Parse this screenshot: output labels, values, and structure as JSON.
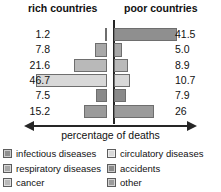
{
  "header": {
    "left_title": "rich countries",
    "right_title": "poor countries"
  },
  "axis": {
    "label": "percentage of deaths",
    "arrow": "double-headed-horizontal"
  },
  "legend": {
    "items": [
      {
        "label": "infectious diseases",
        "color": "#8f8f8f",
        "column": 0,
        "row": 0
      },
      {
        "label": "respiratory diseases",
        "color": "#a8a8a8",
        "column": 0,
        "row": 1
      },
      {
        "label": "cancer",
        "color": "#b9b9b9",
        "column": 0,
        "row": 2
      },
      {
        "label": "circulatory diseases",
        "color": "#d8d8d8",
        "column": 1,
        "row": 0
      },
      {
        "label": "accidents",
        "color": "#8a8a8a",
        "column": 1,
        "row": 1
      },
      {
        "label": "other",
        "color": "#9b9b9b",
        "column": 1,
        "row": 2
      }
    ]
  },
  "chart_data": {
    "type": "bar",
    "subtype": "back-to-back-tornado",
    "title": "",
    "xlabel": "percentage of deaths",
    "ylabel": "",
    "grid": false,
    "legend_position": "bottom",
    "categories": [
      "infectious diseases",
      "respiratory diseases",
      "cancer",
      "circulatory diseases",
      "accidents",
      "other"
    ],
    "series": [
      {
        "name": "rich countries",
        "direction": "left",
        "values": [
          1.2,
          7.8,
          21.6,
          46.7,
          7.5,
          15.2
        ]
      },
      {
        "name": "poor countries",
        "direction": "right",
        "values": [
          41.5,
          5.0,
          8.9,
          10.7,
          7.9,
          26
        ]
      }
    ],
    "value_labels_left": [
      "1.2",
      "7.8",
      "21.6",
      "46.7",
      "7.5",
      "15.2"
    ],
    "value_labels_right": [
      "41.5",
      "5.0",
      "8.9",
      "10.7",
      "7.9",
      "26"
    ],
    "bar_colors": [
      "#8f8f8f",
      "#a8a8a8",
      "#b9b9b9",
      "#d8d8d8",
      "#8a8a8a",
      "#9b9b9b"
    ],
    "xlim": [
      -50,
      50
    ],
    "units": "percent"
  }
}
